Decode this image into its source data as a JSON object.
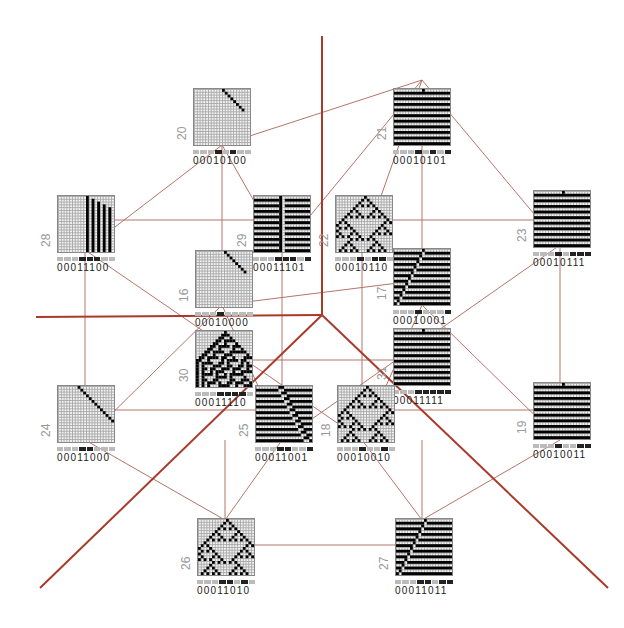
{
  "diagram": {
    "line_color": "#b5746a",
    "axis_color": "#a83a2a",
    "nodes": [
      {
        "id": "20",
        "label": "20",
        "code": "00010100",
        "pattern": "diag-short",
        "x": 193,
        "y": 88
      },
      {
        "id": "21",
        "label": "21",
        "code": "00010101",
        "pattern": "stripes",
        "x": 393,
        "y": 88
      },
      {
        "id": "28",
        "label": "28",
        "code": "00011100",
        "pattern": "bars",
        "x": 57,
        "y": 195
      },
      {
        "id": "29",
        "label": "29",
        "code": "00011101",
        "pattern": "stripes-split",
        "x": 253,
        "y": 195
      },
      {
        "id": "22",
        "label": "22",
        "code": "00010110",
        "pattern": "sierpinski",
        "x": 335,
        "y": 195
      },
      {
        "id": "23",
        "label": "23",
        "code": "00010111",
        "pattern": "stripes",
        "x": 533,
        "y": 190
      },
      {
        "id": "16",
        "label": "16",
        "code": "00010000",
        "pattern": "diag-short",
        "x": 195,
        "y": 250
      },
      {
        "id": "17",
        "label": "17",
        "code": "00010001",
        "pattern": "shift-stripes",
        "x": 393,
        "y": 248
      },
      {
        "id": "30",
        "label": "30",
        "code": "00011110",
        "pattern": "chaos",
        "x": 195,
        "y": 330
      },
      {
        "id": "31",
        "label": "31",
        "code": "00011111",
        "pattern": "stripes",
        "x": 393,
        "y": 328
      },
      {
        "id": "24",
        "label": "24",
        "code": "00011000",
        "pattern": "diag-long",
        "x": 57,
        "y": 385
      },
      {
        "id": "25",
        "label": "25",
        "code": "00011001",
        "pattern": "diag-stripes",
        "x": 255,
        "y": 385
      },
      {
        "id": "18",
        "label": "18",
        "code": "00010010",
        "pattern": "sierpinski-sparse",
        "x": 337,
        "y": 385
      },
      {
        "id": "19",
        "label": "19",
        "code": "00010011",
        "pattern": "stripes",
        "x": 533,
        "y": 382
      },
      {
        "id": "26",
        "label": "26",
        "code": "00011010",
        "pattern": "sierpinski-sparse",
        "x": 197,
        "y": 518
      },
      {
        "id": "27",
        "label": "27",
        "code": "00011011",
        "pattern": "shift-stripes",
        "x": 395,
        "y": 518
      }
    ]
  }
}
